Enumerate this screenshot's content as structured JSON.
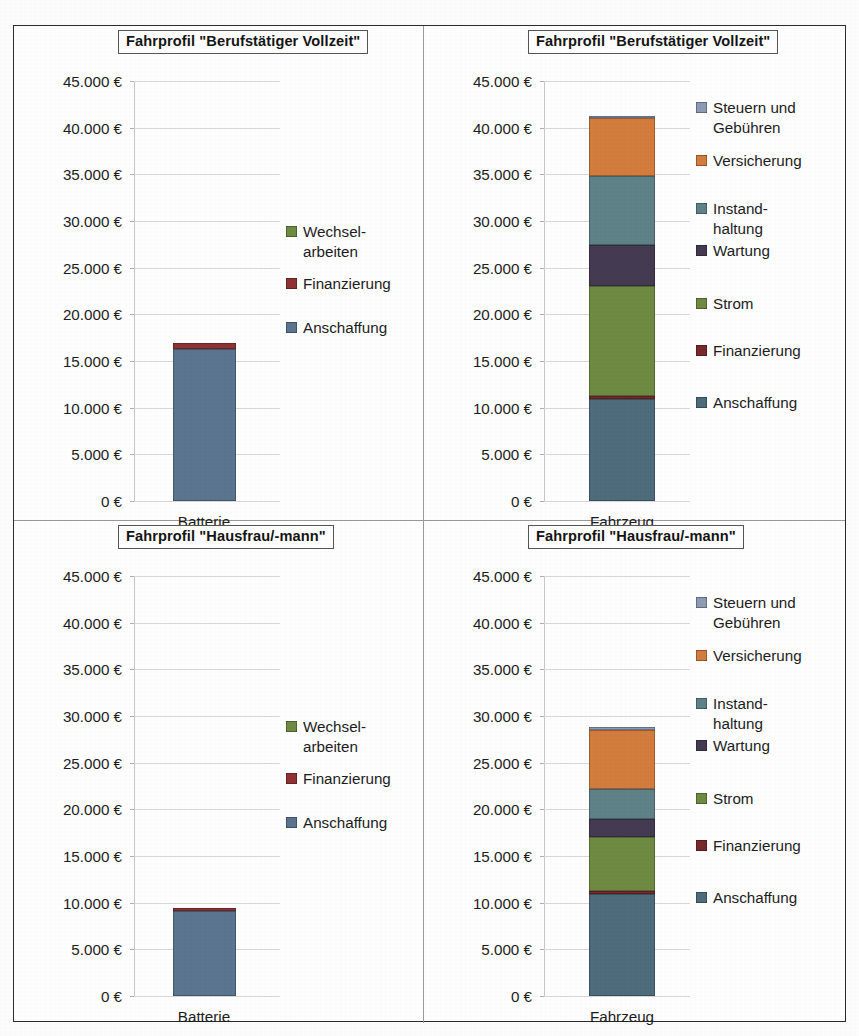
{
  "axis": {
    "tick_labels": [
      "45.000 €",
      "40.000 €",
      "35.000 €",
      "30.000 €",
      "25.000 €",
      "20.000 €",
      "15.000 €",
      "10.000 €",
      "5.000 €",
      "0 €"
    ],
    "ymin": 0,
    "ymax": 45000,
    "ystep": 5000,
    "currency": "€"
  },
  "colors": {
    "anschaffung": "#4e6c7c",
    "finanzierung": "#78292c",
    "strom": "#6f8b42",
    "wartung": "#443b53",
    "instandhaltung": "#5f8289",
    "versicherung": "#d37d3d",
    "steuern": "#8e9bb6",
    "battery_anschaffung": "#5b7590",
    "battery_finanzierung": "#8f3234",
    "frame": "#2b2b2b",
    "divider": "#9a9a9a",
    "gridline": "#d8d8d8"
  },
  "panels": [
    {
      "id": "top-left",
      "title": "Fahrprofil \"Berufstätiger Vollzeit\"",
      "category": "Batterie",
      "legend": [
        {
          "label": "Wechsel-\narbeiten",
          "color_key": "strom"
        },
        {
          "label": "Finanzierung",
          "color_key": "battery_finanzierung"
        },
        {
          "label": "Anschaffung",
          "color_key": "battery_anschaffung"
        }
      ]
    },
    {
      "id": "top-right",
      "title": "Fahrprofil \"Berufstätiger Vollzeit\"",
      "category": "Fahrzeug",
      "legend": [
        {
          "label": "Steuern und\nGebühren",
          "color_key": "steuern"
        },
        {
          "label": "Versicherung",
          "color_key": "versicherung"
        },
        {
          "label": "Instand-\nhaltung",
          "color_key": "instandhaltung"
        },
        {
          "label": "Wartung",
          "color_key": "wartung"
        },
        {
          "label": "Strom",
          "color_key": "strom"
        },
        {
          "label": "Finanzierung",
          "color_key": "finanzierung"
        },
        {
          "label": "Anschaffung",
          "color_key": "anschaffung"
        }
      ]
    },
    {
      "id": "bottom-left",
      "title": "Fahrprofil \"Hausfrau/-mann\"",
      "category": "Batterie",
      "legend": [
        {
          "label": "Wechsel-\narbeiten",
          "color_key": "strom"
        },
        {
          "label": "Finanzierung",
          "color_key": "battery_finanzierung"
        },
        {
          "label": "Anschaffung",
          "color_key": "battery_anschaffung"
        }
      ]
    },
    {
      "id": "bottom-right",
      "title": "Fahrprofil \"Hausfrau/-mann\"",
      "category": "Fahrzeug",
      "legend": [
        {
          "label": "Steuern und\nGebühren",
          "color_key": "steuern"
        },
        {
          "label": "Versicherung",
          "color_key": "versicherung"
        },
        {
          "label": "Instand-\nhaltung",
          "color_key": "instandhaltung"
        },
        {
          "label": "Wartung",
          "color_key": "wartung"
        },
        {
          "label": "Strom",
          "color_key": "strom"
        },
        {
          "label": "Finanzierung",
          "color_key": "finanzierung"
        },
        {
          "label": "Anschaffung",
          "color_key": "anschaffung"
        }
      ]
    }
  ],
  "chart_data": [
    {
      "type": "bar",
      "stacked": true,
      "title": "Fahrprofil \"Berufstätiger Vollzeit\"",
      "panel": "top-left",
      "categories": [
        "Batterie"
      ],
      "xlabel": "",
      "ylabel": "",
      "ylim": [
        0,
        45000
      ],
      "ytick_step": 5000,
      "grid": true,
      "legend_position": "right",
      "series": [
        {
          "name": "Anschaffung",
          "values": [
            16300
          ],
          "color": "#5b7590"
        },
        {
          "name": "Finanzierung",
          "values": [
            600
          ],
          "color": "#8f3234"
        },
        {
          "name": "Wechselarbeiten",
          "values": [
            0
          ],
          "color": "#6f8b42"
        }
      ],
      "total": 16900
    },
    {
      "type": "bar",
      "stacked": true,
      "title": "Fahrprofil \"Berufstätiger Vollzeit\"",
      "panel": "top-right",
      "categories": [
        "Fahrzeug"
      ],
      "xlabel": "",
      "ylabel": "",
      "ylim": [
        0,
        45000
      ],
      "ytick_step": 5000,
      "grid": true,
      "legend_position": "right",
      "series": [
        {
          "name": "Anschaffung",
          "values": [
            10900
          ],
          "color": "#4e6c7c"
        },
        {
          "name": "Finanzierung",
          "values": [
            400
          ],
          "color": "#78292c"
        },
        {
          "name": "Strom",
          "values": [
            11700
          ],
          "color": "#6f8b42"
        },
        {
          "name": "Wartung",
          "values": [
            4400
          ],
          "color": "#443b53"
        },
        {
          "name": "Instandhaltung",
          "values": [
            7400
          ],
          "color": "#5f8289"
        },
        {
          "name": "Versicherung",
          "values": [
            6200
          ],
          "color": "#d37d3d"
        },
        {
          "name": "Steuern und Gebühren",
          "values": [
            200
          ],
          "color": "#8e9bb6"
        }
      ],
      "total": 41200
    },
    {
      "type": "bar",
      "stacked": true,
      "title": "Fahrprofil \"Hausfrau/-mann\"",
      "panel": "bottom-left",
      "categories": [
        "Batterie"
      ],
      "xlabel": "",
      "ylabel": "",
      "ylim": [
        0,
        45000
      ],
      "ytick_step": 5000,
      "grid": true,
      "legend_position": "right",
      "series": [
        {
          "name": "Anschaffung",
          "values": [
            9100
          ],
          "color": "#5b7590"
        },
        {
          "name": "Finanzierung",
          "values": [
            300
          ],
          "color": "#8f3234"
        },
        {
          "name": "Wechselarbeiten",
          "values": [
            0
          ],
          "color": "#6f8b42"
        }
      ],
      "total": 9400
    },
    {
      "type": "bar",
      "stacked": true,
      "title": "Fahrprofil \"Hausfrau/-mann\"",
      "panel": "bottom-right",
      "categories": [
        "Fahrzeug"
      ],
      "xlabel": "",
      "ylabel": "",
      "ylim": [
        0,
        45000
      ],
      "ytick_step": 5000,
      "grid": true,
      "legend_position": "right",
      "series": [
        {
          "name": "Anschaffung",
          "values": [
            10900
          ],
          "color": "#4e6c7c"
        },
        {
          "name": "Finanzierung",
          "values": [
            400
          ],
          "color": "#78292c"
        },
        {
          "name": "Strom",
          "values": [
            5700
          ],
          "color": "#6f8b42"
        },
        {
          "name": "Wartung",
          "values": [
            2000
          ],
          "color": "#443b53"
        },
        {
          "name": "Instandhaltung",
          "values": [
            3200
          ],
          "color": "#5f8289"
        },
        {
          "name": "Versicherung",
          "values": [
            6300
          ],
          "color": "#d37d3d"
        },
        {
          "name": "Steuern und Gebühren",
          "values": [
            300
          ],
          "color": "#8e9bb6"
        }
      ],
      "total": 28800
    }
  ]
}
